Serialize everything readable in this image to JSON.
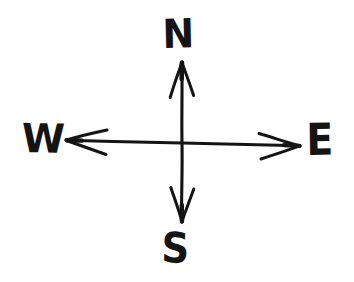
{
  "diagram": {
    "style": "hand-drawn ink sketch",
    "background_color": "#ffffff",
    "ink_color": "#141414",
    "canvas": {
      "width": 354,
      "height": 282
    },
    "center": {
      "x": 182,
      "y": 143
    },
    "labels": {
      "north": "N",
      "west": "W",
      "east": "E",
      "south": "S"
    },
    "axes": [
      {
        "name": "vertical-axis",
        "from_label": "S",
        "to_label": "N",
        "x1": 182,
        "y1": 222,
        "x2": 182,
        "y2": 62,
        "double_headed": true
      },
      {
        "name": "horizontal-axis",
        "from_label": "W",
        "to_label": "E",
        "x1": 66,
        "y1": 140,
        "x2": 300,
        "y2": 146,
        "double_headed": true
      }
    ],
    "arrowheads": [
      {
        "name": "north-arrowhead",
        "tip_x": 182,
        "tip_y": 62,
        "direction": "up"
      },
      {
        "name": "south-arrowhead",
        "tip_x": 182,
        "tip_y": 222,
        "direction": "down"
      },
      {
        "name": "west-arrowhead",
        "tip_x": 66,
        "tip_y": 140,
        "direction": "left"
      },
      {
        "name": "east-arrowhead",
        "tip_x": 300,
        "tip_y": 146,
        "direction": "right"
      }
    ]
  }
}
